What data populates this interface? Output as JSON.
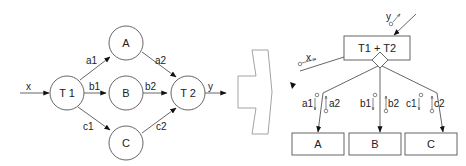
{
  "left_graph": {
    "input_label": "x",
    "output_label": "y",
    "nodes": [
      {
        "id": "T1",
        "label": "T 1"
      },
      {
        "id": "A",
        "label": "A"
      },
      {
        "id": "B",
        "label": "B"
      },
      {
        "id": "C",
        "label": "C"
      },
      {
        "id": "T2",
        "label": "T 2"
      }
    ],
    "edges": [
      {
        "from": "T1",
        "to": "A",
        "label": "a1"
      },
      {
        "from": "T1",
        "to": "B",
        "label": "b1"
      },
      {
        "from": "T1",
        "to": "C",
        "label": "c1"
      },
      {
        "from": "A",
        "to": "T2",
        "label": "a2"
      },
      {
        "from": "B",
        "to": "T2",
        "label": "b2"
      },
      {
        "from": "C",
        "to": "T2",
        "label": "c2"
      }
    ]
  },
  "transform_arrow": {
    "direction": "right"
  },
  "right_graph": {
    "root_label": "T1 + T2",
    "input_label": "x",
    "output_label": "y",
    "children": [
      {
        "label": "A",
        "down_label": "a1",
        "up_label": "a2"
      },
      {
        "label": "B",
        "down_label": "b1",
        "up_label": "b2"
      },
      {
        "label": "C",
        "down_label": "c1",
        "up_label": "c2"
      }
    ]
  }
}
